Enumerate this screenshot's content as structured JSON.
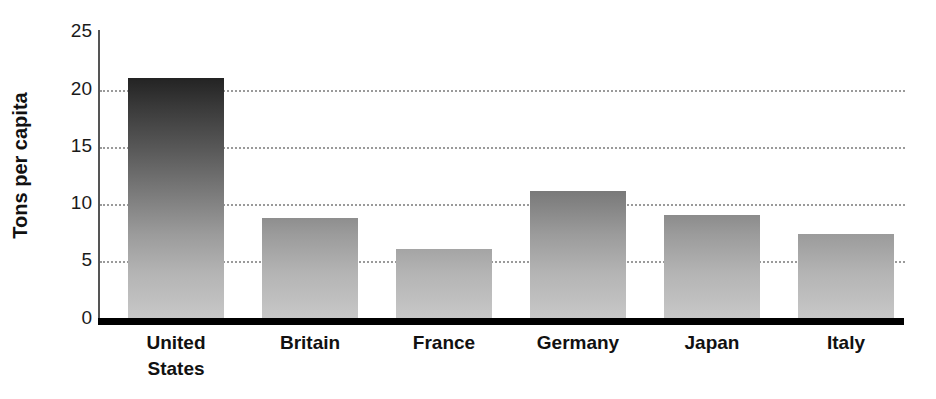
{
  "chart_data": {
    "type": "bar",
    "title": "",
    "subtitle": "",
    "xlabel": "",
    "ylabel": "Tons per capita",
    "ylim": [
      0,
      25
    ],
    "yticks": [
      0,
      5,
      10,
      15,
      20,
      25
    ],
    "ytick_labels": [
      "0",
      "5",
      "10",
      "15",
      "20",
      "25"
    ],
    "grid": "horizontal-dotted",
    "legend": "none",
    "categories": [
      "United States",
      "Britain",
      "France",
      "Germany",
      "Japan",
      "Italy"
    ],
    "category_lines": [
      [
        "United",
        "States"
      ],
      [
        "Britain"
      ],
      [
        "France"
      ],
      [
        "Germany"
      ],
      [
        "Japan"
      ],
      [
        "Italy"
      ]
    ],
    "values": [
      21.4,
      9.1,
      6.4,
      11.5,
      9.4,
      7.7
    ],
    "bar_style": {
      "gradient_top_color": "#232323",
      "gradient_bottom_color": "#c9c9c9",
      "gradient_direction": "vertical"
    },
    "axis_colors": {
      "baseline": "#000000",
      "spine": "#555555",
      "gridline": "#9a9a9a",
      "text": "#111111"
    }
  }
}
